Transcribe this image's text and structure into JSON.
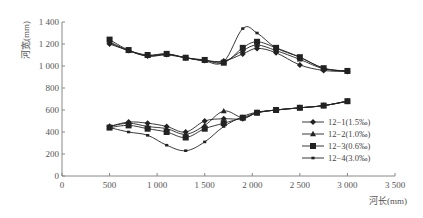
{
  "chart_data": {
    "type": "line",
    "title": "",
    "xlabel": "河长(mm)",
    "ylabel": "河宽(mm)",
    "xlim": [
      0,
      3500
    ],
    "ylim": [
      0,
      1400
    ],
    "x_ticks": [
      0,
      500,
      1000,
      1500,
      2000,
      2500,
      3000,
      3500
    ],
    "x_tick_labels": [
      "0",
      "500",
      "1 000",
      "1 500",
      "2 000",
      "2 500",
      "3 000",
      "3 500"
    ],
    "y_ticks": [
      0,
      200,
      400,
      600,
      800,
      1000,
      1200,
      1400
    ],
    "y_tick_labels": [
      "0",
      "200",
      "400",
      "600",
      "800",
      "1 000",
      "1 200",
      "1 400"
    ],
    "grid": false,
    "legend_position": "right-center",
    "x": [
      500,
      700,
      900,
      1100,
      1300,
      1500,
      1700,
      1900,
      2050,
      2250,
      2500,
      2750,
      3000
    ],
    "series": [
      {
        "name": "12−1(1.5‰)",
        "marker": "diamond",
        "group": "upper",
        "values": [
          1200,
          1140,
          1090,
          1105,
          1075,
          1050,
          1045,
          1110,
          1160,
          1120,
          1010,
          960,
          950
        ]
      },
      {
        "name": "12−2(1.0‰)",
        "marker": "triangle",
        "group": "upper",
        "values": [
          1220,
          1140,
          1095,
          1110,
          1075,
          1050,
          1040,
          1140,
          1190,
          1140,
          1060,
          975,
          955
        ]
      },
      {
        "name": "12−3(0.6‰)",
        "marker": "square",
        "group": "upper",
        "values": [
          1240,
          1145,
          1100,
          1110,
          1075,
          1055,
          1030,
          1165,
          1220,
          1165,
          1080,
          980,
          955
        ]
      },
      {
        "name": "12−4(3.0‰)",
        "marker": "small-square",
        "group": "upper",
        "values": [
          1210,
          1140,
          1090,
          1100,
          1075,
          1045,
          1040,
          1340,
          1300,
          1165,
          1080,
          980,
          950
        ]
      },
      {
        "name": "12−1(1.5‰)",
        "marker": "diamond",
        "group": "lower",
        "values": [
          450,
          490,
          480,
          450,
          400,
          500,
          520,
          520,
          575,
          600,
          620,
          640,
          680
        ]
      },
      {
        "name": "12−2(1.0‰)",
        "marker": "triangle",
        "group": "lower",
        "values": [
          450,
          480,
          450,
          430,
          380,
          460,
          590,
          530,
          575,
          600,
          620,
          640,
          680
        ]
      },
      {
        "name": "12−3(0.6‰)",
        "marker": "square",
        "group": "lower",
        "values": [
          440,
          460,
          430,
          400,
          350,
          430,
          480,
          530,
          575,
          600,
          620,
          640,
          680
        ]
      },
      {
        "name": "12−4(3.0‰)",
        "marker": "small-square",
        "group": "lower",
        "values": [
          440,
          400,
          370,
          280,
          230,
          310,
          450,
          540,
          580,
          600,
          620,
          640,
          680
        ]
      }
    ],
    "legend": [
      "12−1(1.5‰)",
      "12−2(1.0‰)",
      "12−3(0.6‰)",
      "12−4(3.0‰)"
    ]
  },
  "colors": {
    "line": "#222222",
    "axis": "#888888",
    "text": "#555555"
  }
}
